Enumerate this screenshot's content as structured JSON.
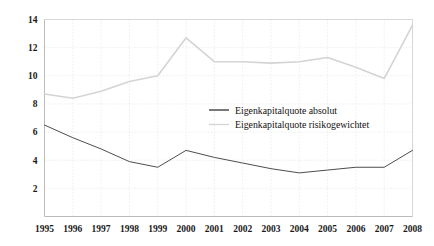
{
  "chart_data": {
    "type": "line",
    "title": "",
    "subtitle": "",
    "xlabel": "",
    "ylabel": "",
    "categories": [
      "1995",
      "1996",
      "1997",
      "1998",
      "1999",
      "2000",
      "2001",
      "2002",
      "2003",
      "2004",
      "2005",
      "2006",
      "2007",
      "2008"
    ],
    "x": [
      1995,
      1996,
      1997,
      1998,
      1999,
      2000,
      2001,
      2002,
      2003,
      2004,
      2005,
      2006,
      2007,
      2008
    ],
    "ylim": [
      0,
      14
    ],
    "xlim": [
      1995,
      2008
    ],
    "yticks": [
      2,
      4,
      6,
      8,
      10,
      12,
      14
    ],
    "ytick_labels": [
      "2",
      "4",
      "6",
      "8",
      "10",
      "12",
      "14"
    ],
    "xtick_labels": [
      "1995",
      "1996",
      "1997",
      "1998",
      "1999",
      "2000",
      "2001",
      "2002",
      "2003",
      "2004",
      "2005",
      "2006",
      "2007",
      "2008"
    ],
    "grid": true,
    "grid_axis": "both",
    "legend_position": "inside-center-right",
    "series": [
      {
        "name": "Eigenkapitalquote absolut",
        "color": "#4d4d4d",
        "values": [
          6.5,
          5.6,
          4.8,
          3.9,
          3.5,
          4.7,
          4.2,
          3.8,
          3.4,
          3.1,
          3.3,
          3.5,
          3.5,
          4.7
        ]
      },
      {
        "name": "Eigenkapitalquote risikogewichtet",
        "color": "#d4d4d4",
        "values": [
          8.7,
          8.4,
          8.9,
          9.6,
          10.0,
          12.7,
          11.0,
          11.0,
          10.9,
          11.0,
          11.3,
          10.6,
          9.8,
          13.6
        ]
      }
    ]
  },
  "legend": {
    "entries": [
      {
        "label": "Eigenkapitalquote absolut",
        "color": "#4d4d4d"
      },
      {
        "label": "Eigenkapitalquote risikogewichtet",
        "color": "#d4d4d4"
      }
    ]
  },
  "axes": {
    "y_tick_labels": [
      "14",
      "12",
      "10",
      "8",
      "6",
      "4",
      "2"
    ],
    "x_tick_labels": [
      "1995",
      "1996",
      "1997",
      "1998",
      "1999",
      "2000",
      "2001",
      "2002",
      "2003",
      "2004",
      "2005",
      "2006",
      "2007",
      "2008"
    ]
  },
  "colors": {
    "background": "#ffffff",
    "grid": "#e2e2e2",
    "axis": "#b4b4b4",
    "series_dark": "#4d4d4d",
    "series_light": "#d4d4d4",
    "text": "#1a1a1a"
  }
}
